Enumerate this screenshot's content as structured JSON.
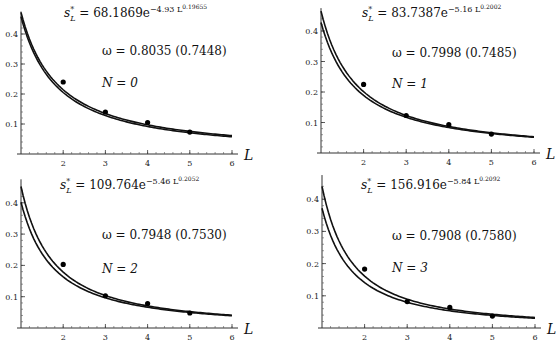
{
  "chart_data": [
    {
      "type": "line",
      "panel": "top-left",
      "title": "",
      "xlabel": "L",
      "ylabel": "",
      "xlim": [
        1,
        6
      ],
      "ylim": [
        0,
        0.45
      ],
      "x_ticks": [
        "2",
        "3",
        "4",
        "5",
        "6"
      ],
      "y_ticks": [
        "0.1",
        "0.2",
        "0.3",
        "0.4"
      ],
      "formula": {
        "lhs": "s*_L = 68.1869e",
        "exp": "−4.93 L",
        "exp2": "0.19655"
      },
      "omega_label": "ω = 0.8035 (0.7448)",
      "n_label": "N = 0",
      "series": [
        {
          "name": "upper curve",
          "a": 0.472,
          "b": 1.14
        },
        {
          "name": "lower curve",
          "a": 0.458,
          "b": 1.16
        }
      ],
      "points": {
        "x": [
          2,
          3,
          4,
          5
        ],
        "y": [
          0.24,
          0.14,
          0.105,
          0.073
        ]
      }
    },
    {
      "type": "line",
      "panel": "top-right",
      "xlabel": "L",
      "xlim": [
        1,
        6
      ],
      "ylim": [
        0,
        0.45
      ],
      "x_ticks": [
        "2",
        "3",
        "4",
        "5",
        "6"
      ],
      "y_ticks": [
        "0.1",
        "0.2",
        "0.3",
        "0.4"
      ],
      "formula": {
        "lhs": "s*_L = 83.7387e",
        "exp": "−5.16 L",
        "exp2": "0.2002"
      },
      "omega_label": "ω = 0.7998 (0.7485)",
      "n_label": "N = 1",
      "series": [
        {
          "name": "upper curve",
          "a": 0.465,
          "b": 1.21
        },
        {
          "name": "lower curve",
          "a": 0.428,
          "b": 1.18
        }
      ],
      "points": {
        "x": [
          2,
          3,
          4,
          5
        ],
        "y": [
          0.225,
          0.123,
          0.093,
          0.062
        ]
      }
    },
    {
      "type": "line",
      "panel": "bottom-left",
      "xlabel": "L",
      "xlim": [
        1,
        6
      ],
      "ylim": [
        0,
        0.45
      ],
      "x_ticks": [
        "2",
        "3",
        "4",
        "5",
        "6"
      ],
      "y_ticks": [
        "0.1",
        "0.2",
        "0.3",
        "0.4"
      ],
      "formula": {
        "lhs": "s*_L = 109.764e",
        "exp": "−5.46 L",
        "exp2": "0.2052"
      },
      "omega_label": "ω = 0.7948 (0.7530)",
      "n_label": "N = 2",
      "series": [
        {
          "name": "upper curve",
          "a": 0.452,
          "b": 1.34
        },
        {
          "name": "lower curve",
          "a": 0.402,
          "b": 1.3
        }
      ],
      "points": {
        "x": [
          2,
          3,
          4,
          5
        ],
        "y": [
          0.203,
          0.103,
          0.078,
          0.048
        ]
      }
    },
    {
      "type": "line",
      "panel": "bottom-right",
      "xlabel": "L",
      "xlim": [
        1,
        6
      ],
      "ylim": [
        0,
        0.45
      ],
      "x_ticks": [
        "2",
        "3",
        "4",
        "5",
        "6"
      ],
      "y_ticks": [
        "0.1",
        "0.2",
        "0.3",
        "0.4"
      ],
      "formula": {
        "lhs": "s*_L = 156.916e",
        "exp": "−5.84 L",
        "exp2": "0.2092"
      },
      "omega_label": "ω = 0.7908 (0.7580)",
      "n_label": "N = 3",
      "series": [
        {
          "name": "upper curve",
          "a": 0.44,
          "b": 1.45
        },
        {
          "name": "lower curve",
          "a": 0.372,
          "b": 1.4
        }
      ],
      "points": {
        "x": [
          2,
          3,
          4,
          5
        ],
        "y": [
          0.183,
          0.082,
          0.064,
          0.037
        ]
      }
    }
  ]
}
